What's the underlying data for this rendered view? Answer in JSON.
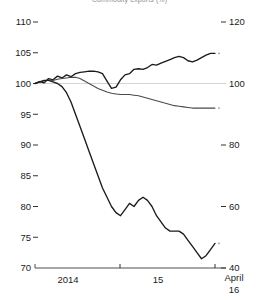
{
  "title": "Commodity exports (%)",
  "axes": {
    "left": {
      "ticks": [
        "110",
        "105",
        "100",
        "95",
        "90",
        "85",
        "80",
        "75",
        "70"
      ],
      "min": 70,
      "max": 110,
      "step": 5
    },
    "right": {
      "ticks": [
        "120",
        "100",
        "80",
        "60",
        "40"
      ],
      "min": 40,
      "max": 120,
      "step": 20
    },
    "x": {
      "ticks": [
        {
          "label": "2014",
          "x": 0.3
        },
        {
          "label": "15",
          "x": 0.5
        },
        {
          "label": "April",
          "x": 0.98
        },
        {
          "label": "16",
          "x": 0.98
        }
      ],
      "tick_labels": [
        "2014",
        "15",
        "April",
        "16"
      ]
    }
  },
  "colors": {
    "line": "#1b1b1b",
    "line_thin": "#4a4a4a",
    "grid": "#cfcfcf",
    "axis": "#3a3a3a",
    "title": "#8d8d93",
    "background": "#ffffff"
  },
  "chart_data": {
    "type": "line",
    "title": "Commodity exports (%)",
    "xlabel": "",
    "ylabel": "",
    "ylim": [
      70,
      110
    ],
    "ylim_right": [
      40,
      120
    ],
    "grid": true,
    "gridlines": [
      100
    ],
    "legend": "none",
    "x_tick_labels": [
      "2014",
      "15",
      "April 16"
    ],
    "series": [
      {
        "name": "rising-series",
        "axis": "left",
        "values": [
          100.0,
          100.3,
          100.1,
          100.8,
          100.6,
          101.2,
          100.9,
          101.4,
          101.1,
          101.6,
          101.8,
          101.9,
          102.0,
          102.0,
          101.9,
          101.6,
          100.4,
          99.2,
          99.4,
          100.6,
          101.4,
          101.6,
          102.3,
          102.4,
          102.3,
          102.6,
          103.1,
          103.0,
          103.3,
          103.6,
          103.9,
          104.2,
          104.4,
          104.2,
          103.7,
          103.5,
          103.8,
          104.2,
          104.6,
          104.9,
          104.9
        ]
      },
      {
        "name": "declining-flat-series",
        "axis": "left",
        "values": [
          100.0,
          100.2,
          100.4,
          100.6,
          100.5,
          100.7,
          100.8,
          100.9,
          101.0,
          101.0,
          100.8,
          100.4,
          100.0,
          99.6,
          99.2,
          98.9,
          98.6,
          98.4,
          98.3,
          98.2,
          98.2,
          98.2,
          98.1,
          98.0,
          97.8,
          97.6,
          97.4,
          97.2,
          97.0,
          96.8,
          96.6,
          96.4,
          96.3,
          96.2,
          96.1,
          96.0,
          96.0,
          96.0,
          96.0,
          96.0,
          96.0
        ]
      },
      {
        "name": "commodity-price-series",
        "axis": "right",
        "values": [
          100,
          100.5,
          101,
          101,
          100.5,
          100,
          99,
          97,
          94,
          90,
          86,
          82,
          78,
          74,
          70,
          66,
          63,
          60,
          58,
          57,
          59,
          61,
          60,
          62,
          63,
          62,
          60,
          57,
          55,
          53,
          52,
          52,
          52,
          51,
          49,
          47,
          45,
          43,
          44,
          46,
          48
        ]
      }
    ]
  }
}
